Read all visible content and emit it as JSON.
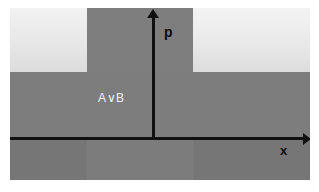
{
  "figure": {
    "title": "",
    "type": "phase-space-region-diagram",
    "background_color": "#ffffff",
    "canvas_color": "#7d7d7d"
  },
  "axes": {
    "vertical": {
      "label": "p",
      "name": "momentum-axis",
      "direction": "up",
      "arrowhead": true,
      "color": "#111111"
    },
    "horizontal": {
      "label": "x",
      "name": "position-axis",
      "direction": "right",
      "arrowhead": true,
      "color": "#111111"
    },
    "origin_note": ""
  },
  "regions": {
    "highlighted": {
      "label": "A∨B",
      "description": "shaded support region",
      "fill_color": "#7e7e7e",
      "text_color": "#f0f0f0"
    },
    "upper_left": {
      "name": "upper-left-light-block",
      "fill_top": "#f2f2f2",
      "fill_bottom": "#dcdcdc"
    },
    "upper_right": {
      "name": "upper-right-light-block",
      "fill_top": "#f3f3f3",
      "fill_bottom": "#dddddd"
    },
    "mid_band": {
      "name": "mid-dark-band",
      "fill_color": "#7d7d7d"
    },
    "below_axis": {
      "name": "below-axis-band",
      "fill_color": "#767676"
    },
    "below_axis_center": {
      "name": "below-axis-center-band",
      "fill_color": "#7c7c7c"
    }
  }
}
